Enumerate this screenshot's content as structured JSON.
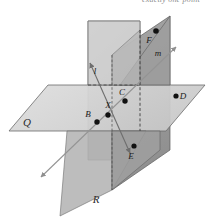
{
  "caption": {
    "text": "exactly one point"
  },
  "figure": {
    "planes": [
      {
        "id": "plane-q",
        "label": "Q",
        "orientation": "horizontal",
        "fill": "#d6d6d6",
        "stroke": "#6b6b6b",
        "label_x": 27,
        "label_y": 133
      },
      {
        "id": "plane-r",
        "label": "R",
        "orientation": "vertical-front",
        "fill": "#a9a9a9",
        "stroke": "#5d5d5d",
        "label_x": 96,
        "label_y": 203
      },
      {
        "id": "plane-back",
        "label": "",
        "orientation": "vertical-back",
        "fill": "#c3c3c3",
        "stroke": "#6b6b6b",
        "label_x": 0,
        "label_y": 0
      }
    ],
    "lines": [
      {
        "id": "line-l",
        "label": "l",
        "label_x": 95,
        "label_y": 74,
        "stroke": "#6e6e6e",
        "arrows": "both"
      },
      {
        "id": "line-m",
        "label": "m",
        "label_x": 158,
        "label_y": 56,
        "stroke": "#8a8a8a",
        "arrows": "both"
      }
    ],
    "points": [
      {
        "id": "point-b",
        "label": "B",
        "cx": 97,
        "cy": 122,
        "label_x": 88,
        "label_y": 117
      },
      {
        "id": "point-x",
        "label": "X",
        "cx": 108,
        "cy": 115,
        "label_x": 108,
        "label_y": 108
      },
      {
        "id": "point-c",
        "label": "C",
        "cx": 125,
        "cy": 100,
        "label_x": 122,
        "label_y": 93
      },
      {
        "id": "point-d",
        "label": "D",
        "cx": 176,
        "cy": 96,
        "label_x": 181,
        "label_y": 99
      },
      {
        "id": "point-e",
        "label": "E",
        "cx": 134,
        "cy": 145,
        "label_x": 130,
        "label_y": 158
      },
      {
        "id": "point-f",
        "label": "F",
        "cx": 155,
        "cy": 31,
        "label_x": 148,
        "label_y": 42
      }
    ],
    "colors": {
      "background": "#ffffff",
      "plane_light": "#d6d6d6",
      "plane_mid": "#c3c3c3",
      "plane_dark": "#a9a9a9",
      "outline": "#6b6b6b",
      "point": "#111111",
      "caption_text": "#8d8d8d"
    }
  }
}
